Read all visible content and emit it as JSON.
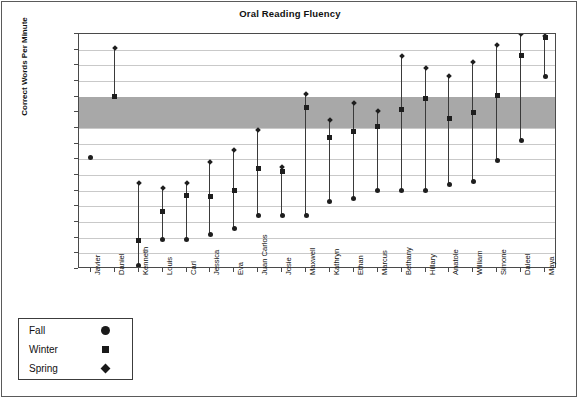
{
  "chart_data": {
    "type": "scatter",
    "title": "Oral Reading Fluency",
    "xlabel": "",
    "ylabel": "Correct Words Per Minute",
    "ylim": [
      0,
      150
    ],
    "ytick_step": 10,
    "yticks": [
      150,
      140,
      130,
      120,
      110,
      100,
      90,
      80,
      70,
      60,
      50,
      40,
      30,
      20,
      10,
      0
    ],
    "grid": true,
    "legend_position": "below-left-outside",
    "target_band": {
      "label": "target range",
      "min": 90,
      "max": 110,
      "color": "#a8a8a8"
    },
    "categories": [
      "Javier",
      "Daniel",
      "Kenneth",
      "Louis",
      "Carl",
      "Jessica",
      "Eva",
      "Juan Carlos",
      "Josie",
      "Maxwell",
      "Kathryn",
      "Ethan",
      "Marcus",
      "Bethany",
      "Hillary",
      "Anatole",
      "William",
      "Simone",
      "Daleel",
      "Maya"
    ],
    "series": [
      {
        "name": "Fall",
        "marker": "circle",
        "values": [
          71,
          null,
          2,
          19,
          19,
          22,
          26,
          34,
          34,
          34,
          43,
          45,
          50,
          50,
          50,
          54,
          56,
          69,
          82,
          123
        ]
      },
      {
        "name": "Winter",
        "marker": "square",
        "values": [
          null,
          110,
          18,
          37,
          47,
          46,
          50,
          64,
          62,
          103,
          84,
          88,
          91,
          102,
          109,
          96,
          100,
          111,
          136,
          148
        ]
      },
      {
        "name": "Spring",
        "marker": "diamond",
        "values": [
          null,
          141,
          55,
          52,
          55,
          68,
          76,
          89,
          65,
          112,
          95,
          106,
          101,
          136,
          128,
          123,
          132,
          143,
          150,
          149
        ]
      }
    ]
  },
  "legend": {
    "entries": [
      {
        "label": "Fall",
        "glyph": "circle-marker-icon"
      },
      {
        "label": "Winter",
        "glyph": "square-marker-icon"
      },
      {
        "label": "Spring",
        "glyph": "diamond-marker-icon"
      }
    ]
  }
}
